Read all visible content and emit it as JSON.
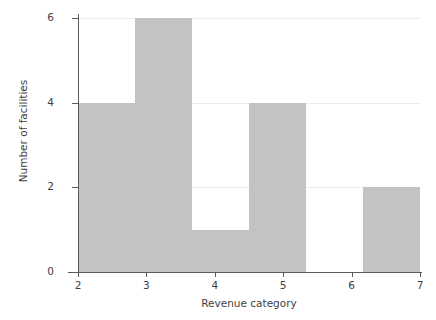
{
  "chart_data": {
    "type": "bar",
    "title": "",
    "xlabel": "Revenue category",
    "ylabel": "Number of facilities",
    "xlim": [
      1.6,
      7.2
    ],
    "ylim": [
      0,
      6.2
    ],
    "xticks": [
      "2",
      "3",
      "4",
      "5",
      "6",
      "7"
    ],
    "xtick_values": [
      2,
      3,
      4,
      5,
      6,
      7
    ],
    "yticks": [
      "0",
      "2",
      "4",
      "6"
    ],
    "ytick_values": [
      0,
      2,
      4,
      6
    ],
    "grid": "horizontal",
    "legend": "none",
    "bar_color": "#c3c3c3",
    "bin_width": 0.8333,
    "bins": [
      {
        "left": 2.0,
        "right": 2.8333,
        "value": 4
      },
      {
        "left": 2.8333,
        "right": 3.6667,
        "value": 6
      },
      {
        "left": 3.6667,
        "right": 4.5,
        "value": 1
      },
      {
        "left": 4.5,
        "right": 5.3333,
        "value": 4
      },
      {
        "left": 5.3333,
        "right": 6.1667,
        "value": 0
      },
      {
        "left": 6.1667,
        "right": 7.0,
        "value": 2
      }
    ],
    "categories": [
      "2.0-2.83",
      "2.83-3.67",
      "3.67-4.5",
      "4.5-5.33",
      "5.33-6.17",
      "6.17-7.0"
    ],
    "values": [
      4,
      6,
      1,
      4,
      0,
      2
    ]
  }
}
